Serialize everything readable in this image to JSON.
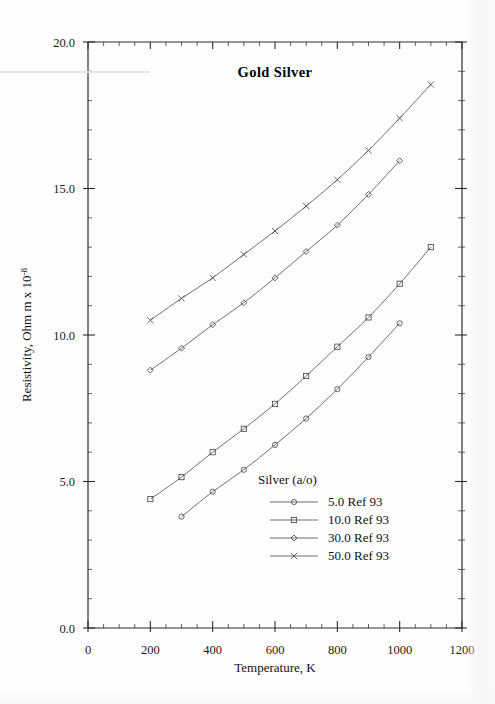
{
  "figure": {
    "title": "Gold  Silver",
    "background_color": "#fefefe",
    "line_color": "#555555",
    "axis_color": "#2b2b2b",
    "text_color": "#111111"
  },
  "axes": {
    "x": {
      "label": "Temperature,  K",
      "min": 0,
      "max": 1200,
      "major_step": 200,
      "minor_step": 50,
      "tick_labels": [
        "0",
        "200",
        "400",
        "600",
        "800",
        "1000",
        "1200"
      ],
      "tick_values": [
        0,
        200,
        400,
        600,
        800,
        1000,
        1200
      ]
    },
    "y": {
      "label_main": "Resistivity, Ohm m x 10",
      "label_exponent": "-8",
      "min": 0,
      "max": 20,
      "major_step": 5,
      "minor_step": 1,
      "tick_labels": [
        "0.0",
        "5.0",
        "10.0",
        "15.0",
        "20.0"
      ],
      "tick_values": [
        0,
        5,
        10,
        15,
        20
      ]
    }
  },
  "legend": {
    "title": "Silver (a/o)",
    "entries": [
      {
        "label": "5.0 Ref 93",
        "marker": "circle"
      },
      {
        "label": "10.0 Ref 93",
        "marker": "square"
      },
      {
        "label": "30.0 Ref 93",
        "marker": "diamond"
      },
      {
        "label": "50.0 Ref 93",
        "marker": "cross"
      }
    ]
  },
  "chart_data": {
    "type": "line",
    "title": "Gold  Silver",
    "xlabel": "Temperature,  K",
    "ylabel": "Resistivity, Ohm m x 10^-8",
    "xlim": [
      0,
      1200
    ],
    "ylim": [
      0,
      20
    ],
    "grid": false,
    "legend_position": "inside-lower-right",
    "legend_title": "Silver (a/o)",
    "series": [
      {
        "name": "5.0 Ref 93",
        "marker": "circle",
        "x": [
          300,
          400,
          500,
          600,
          700,
          800,
          900,
          1000
        ],
        "y": [
          3.8,
          4.65,
          5.4,
          6.25,
          7.15,
          8.15,
          9.25,
          10.4
        ]
      },
      {
        "name": "10.0 Ref 93",
        "marker": "square",
        "x": [
          200,
          300,
          400,
          500,
          600,
          700,
          800,
          900,
          1000,
          1100
        ],
        "y": [
          4.4,
          5.15,
          6.0,
          6.8,
          7.65,
          8.6,
          9.6,
          10.6,
          11.75,
          13.0
        ]
      },
      {
        "name": "30.0 Ref 93",
        "marker": "diamond",
        "x": [
          200,
          300,
          400,
          500,
          600,
          700,
          800,
          900,
          1000
        ],
        "y": [
          8.8,
          9.55,
          10.35,
          11.1,
          11.95,
          12.85,
          13.75,
          14.8,
          15.95
        ]
      },
      {
        "name": "50.0 Ref 93",
        "marker": "cross",
        "x": [
          200,
          300,
          400,
          500,
          600,
          700,
          800,
          900,
          1000,
          1100
        ],
        "y": [
          10.5,
          11.25,
          11.95,
          12.75,
          13.55,
          14.4,
          15.3,
          16.3,
          17.4,
          18.55
        ]
      }
    ]
  }
}
